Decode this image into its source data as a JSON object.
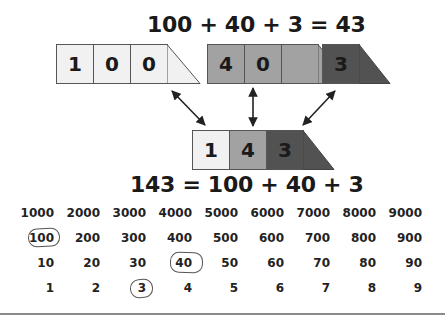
{
  "top_equation": "100 + 40 + 3 = 43",
  "bottom_equation": "143 = 100 + 40 + 3",
  "top_cards": [
    {
      "digits": [
        "1",
        "0",
        "0"
      ],
      "shade": "light",
      "color": "#f1f1f1"
    },
    {
      "digits": [
        "4",
        "0"
      ],
      "shade": "mid",
      "color": "#a2a2a2"
    },
    {
      "digits": [
        "3"
      ],
      "shade": "dark",
      "color": "#525252"
    }
  ],
  "combined_card": {
    "digits": [
      "1",
      "4",
      "3"
    ],
    "colors": [
      "#f1f1f1",
      "#a2a2a2",
      "#525252"
    ]
  },
  "arrows": [
    "double-headed diagonal arrow from 100 card",
    "double-headed vertical arrow from 40 card",
    "double-headed diagonal arrow from 3 card"
  ],
  "place_value_grid": {
    "rows": [
      [
        "1000",
        "2000",
        "3000",
        "4000",
        "5000",
        "6000",
        "7000",
        "8000",
        "9000"
      ],
      [
        "100",
        "200",
        "300",
        "400",
        "500",
        "600",
        "700",
        "800",
        "900"
      ],
      [
        "10",
        "20",
        "30",
        "40",
        "50",
        "60",
        "70",
        "80",
        "90"
      ],
      [
        "1",
        "2",
        "3",
        "4",
        "5",
        "6",
        "7",
        "8",
        "9"
      ]
    ],
    "circled": [
      "100",
      "40",
      "3"
    ]
  }
}
